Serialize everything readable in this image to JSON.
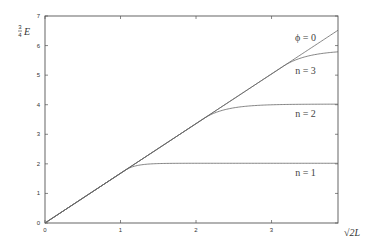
{
  "chart_data": {
    "type": "line",
    "title": "",
    "xlabel": "√2L",
    "ylabel_frac": {
      "num": "3",
      "den": "4"
    },
    "ylabel_var": "E",
    "xlim": [
      0,
      3.88
    ],
    "ylim": [
      0,
      7
    ],
    "xticks": [
      0,
      1,
      2,
      3
    ],
    "yticks": [
      0,
      1,
      2,
      3,
      4,
      5,
      6,
      7
    ],
    "grid": false,
    "legend": "none (inline curve labels at right)",
    "series": [
      {
        "name": "phi0",
        "label": "ϕ = 0",
        "slope": 1.68,
        "kind": "linear"
      },
      {
        "name": "n3",
        "label": "n = 3",
        "saturation": 5.85,
        "departure_x": 3.15,
        "kind": "saturating"
      },
      {
        "name": "n2",
        "label": "n = 2",
        "saturation": 4.02,
        "departure_x": 2.1,
        "kind": "saturating"
      },
      {
        "name": "n1",
        "label": "n = 1",
        "saturation": 2.02,
        "departure_x": 1.06,
        "kind": "saturating"
      }
    ],
    "annotations": [
      {
        "text": "ϕ = 0",
        "x": 3.45,
        "y": 6.15
      },
      {
        "text": "n = 3",
        "x": 3.45,
        "y": 5.05
      },
      {
        "text": "n = 2",
        "x": 3.45,
        "y": 3.6
      },
      {
        "text": "n = 1",
        "x": 3.45,
        "y": 1.6
      }
    ]
  }
}
